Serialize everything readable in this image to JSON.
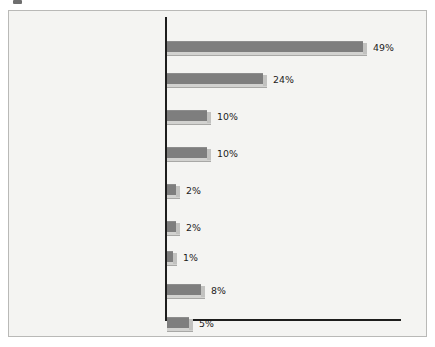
{
  "figure": {
    "background_color": "#f4f4f2",
    "border_color": "#b9b9b7",
    "bar_color": "#7e7e7e",
    "bar_shadow_color": "#d2d2d0",
    "axis_color": "#1d1d1d",
    "text_color": "#1b1b1b"
  },
  "chart_data": {
    "type": "bar",
    "orientation": "horizontal",
    "title": "",
    "subtitle": "",
    "xlabel": "",
    "ylabel": "",
    "xlim": [
      0,
      55
    ],
    "grid": false,
    "legend": false,
    "value_suffix": "%",
    "categories": [
      "Beliefs that living together was wrong/Religion/Upbringing/ Social norms",
      "Love and commitment",
      "Had children/Expecting/ Wanted children",
      "It was time/Easier/ Just wanted to",
      "Make a legal commitment",
      "Young and stupid/ Young/Dumb",
      "Financial reasons/ Health benefits",
      "Other (Miscellaneous)",
      "Don't know"
    ],
    "values": [
      49,
      24,
      10,
      10,
      2,
      2,
      1,
      8,
      5
    ],
    "value_labels": [
      "49%",
      "24%",
      "10%",
      "10%",
      "2%",
      "2%",
      "1%",
      "8%",
      "5%"
    ],
    "bars": [
      {
        "label_lines": [
          "Beliefs that living together was",
          "wrong/Religion/Upbringing/",
          "Social norms"
        ],
        "value": 49,
        "value_label": "49%",
        "top": 18,
        "label_top": 18,
        "bar_top": 30,
        "px_width": 196
      },
      {
        "label_lines": [
          "Love and commitment"
        ],
        "value": 24,
        "value_label": "24%",
        "top": 62,
        "label_top": 62,
        "bar_top": 62,
        "px_width": 96
      },
      {
        "label_lines": [
          "Had children/Expecting/",
          "Wanted children"
        ],
        "value": 10,
        "value_label": "10%",
        "top": 99,
        "label_top": 99,
        "bar_top": 99,
        "px_width": 40
      },
      {
        "label_lines": [
          "It was time/Easier/",
          "Just wanted to"
        ],
        "value": 10,
        "value_label": "10%",
        "top": 136,
        "label_top": 136,
        "bar_top": 136,
        "px_width": 40
      },
      {
        "label_lines": [
          "Make a legal",
          "commitment"
        ],
        "value": 2,
        "value_label": "2%",
        "top": 173,
        "label_top": 173,
        "bar_top": 173,
        "px_width": 9
      },
      {
        "label_lines": [
          "Young and stupid/",
          "Young/Dumb"
        ],
        "value": 2,
        "value_label": "2%",
        "top": 210,
        "label_top": 210,
        "bar_top": 210,
        "px_width": 9
      },
      {
        "label_lines": [
          "Financial reasons/",
          "Health benefits"
        ],
        "value": 1,
        "value_label": "1%",
        "top": 240,
        "label_top": 240,
        "bar_top": 240,
        "px_width": 6
      },
      {
        "label_lines": [
          "Other (Miscellaneous)"
        ],
        "value": 8,
        "value_label": "8%",
        "top": 273,
        "label_top": 273,
        "bar_top": 273,
        "px_width": 34
      },
      {
        "label_lines": [
          "Don't know"
        ],
        "value": 5,
        "value_label": "5%",
        "top": 306,
        "label_top": 306,
        "bar_top": 306,
        "px_width": 22
      }
    ]
  }
}
